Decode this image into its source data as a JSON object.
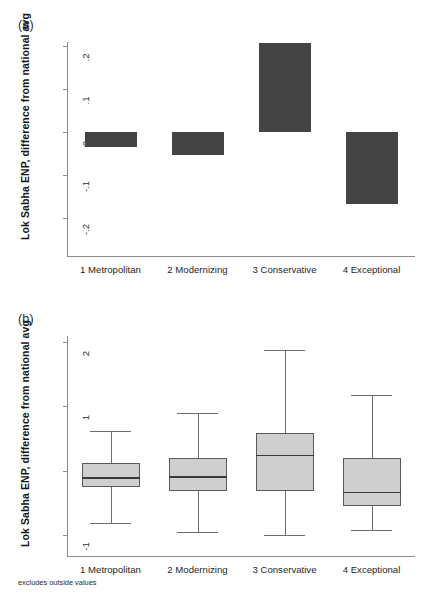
{
  "figure": {
    "panels": [
      {
        "tag": "(a)"
      },
      {
        "tag": "(b)"
      }
    ]
  },
  "panel_a": {
    "tag": "(a)",
    "ytitle": "Lok Sabha ENP, difference from national avg",
    "ytick_labels": [
      ".2",
      ".1",
      "0",
      "-.1",
      "-.2"
    ],
    "xtick_labels": [
      "1 Metropolitan",
      "2 Modernizing",
      "3 Conservative",
      "4 Exceptional"
    ]
  },
  "panel_b": {
    "tag": "(b)",
    "ytitle": "Lok Sabha ENP, difference from national avg",
    "ytick_labels": [
      "2",
      "1",
      "0",
      "-1"
    ],
    "xtick_labels": [
      "1 Metropolitan",
      "2 Modernizing",
      "3 Conservative",
      "4 Exceptional"
    ],
    "note": "excludes outside values"
  },
  "colors": {
    "bar_fill": "#444444",
    "box_fill": "#cfcfcf",
    "box_edge": "#5a5a5a",
    "median": "#3a3a3a",
    "axis": "#8c8c8c",
    "background": "#ffffff"
  },
  "chart_data": [
    {
      "type": "bar",
      "panel": "(a)",
      "title": "",
      "xlabel": "",
      "ylabel": "Lok Sabha ENP, difference from national avg",
      "categories": [
        "1 Metropolitan",
        "2 Modernizing",
        "3 Conservative",
        "4 Exceptional"
      ],
      "values": [
        -0.035,
        -0.053,
        0.207,
        -0.168
      ],
      "ylim": [
        -0.2,
        0.2
      ],
      "yticks": [
        0.2,
        0.1,
        0,
        -0.1,
        -0.2
      ],
      "ytick_labels": [
        ".2",
        ".1",
        "0",
        "-.1",
        "-.2"
      ],
      "grid": false,
      "legend": "none",
      "baseline": 0
    },
    {
      "type": "box",
      "panel": "(b)",
      "title": "",
      "xlabel": "",
      "ylabel": "Lok Sabha ENP, difference from national avg",
      "annotation": "excludes outside values",
      "categories": [
        "1 Metropolitan",
        "2 Modernizing",
        "3 Conservative",
        "4 Exceptional"
      ],
      "ylim": [
        -1.05,
        2.05
      ],
      "yticks": [
        2,
        1,
        0,
        -1
      ],
      "ytick_labels": [
        "2",
        "1",
        "0",
        "-1"
      ],
      "grid": false,
      "legend": "none",
      "boxes": [
        {
          "category": "1 Metropolitan",
          "whisker_low": -0.82,
          "q1": -0.26,
          "median": -0.1,
          "q3": 0.12,
          "whisker_high": 0.62
        },
        {
          "category": "2 Modernizing",
          "whisker_low": -0.95,
          "q1": -0.32,
          "median": -0.09,
          "q3": 0.19,
          "whisker_high": 0.89
        },
        {
          "category": "3 Conservative",
          "whisker_low": -1.0,
          "q1": -0.31,
          "median": 0.25,
          "q3": 0.59,
          "whisker_high": 1.88
        },
        {
          "category": "4 Exceptional",
          "whisker_low": -0.92,
          "q1": -0.55,
          "median": -0.33,
          "q3": 0.19,
          "whisker_high": 1.17
        }
      ]
    }
  ]
}
